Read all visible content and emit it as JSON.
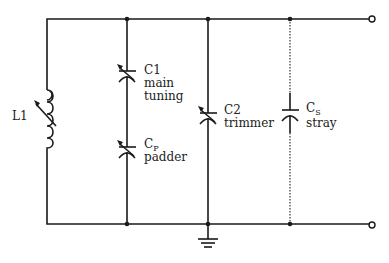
{
  "diagram": {
    "components": {
      "L1": {
        "label": "L1"
      },
      "C1": {
        "label": "C1",
        "desc_line1": "main",
        "desc_line2": "tuning"
      },
      "CP": {
        "label": "C",
        "subscript": "P",
        "desc": "padder"
      },
      "C2": {
        "label": "C2",
        "desc": "trimmer"
      },
      "CS": {
        "label": "C",
        "subscript": "S",
        "desc": "stray"
      }
    },
    "terminals": [
      "top-output",
      "bottom-output"
    ],
    "ground": "chassis ground at C2 bottom node",
    "colors": {
      "line": "#1a1a1a",
      "background": "#ffffff"
    }
  }
}
